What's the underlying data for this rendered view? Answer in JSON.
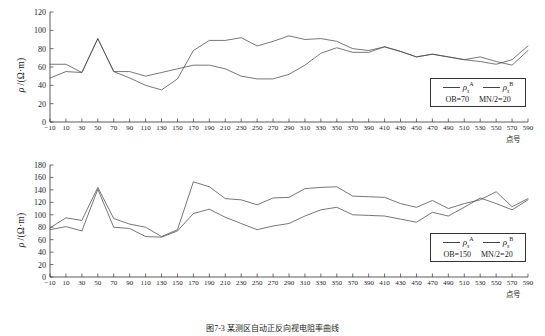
{
  "figure": {
    "caption": "图7-3  某测区自动正反向视电阻率曲线",
    "axis": {
      "ylabel_rho": "ρ",
      "ylabel_unit": "/(Ω·m)",
      "xlabel": "点号"
    }
  },
  "chart_data": [
    {
      "id": "top",
      "type": "line",
      "title": "",
      "xlabel": "点号",
      "ylabel": "ρ/(Ω·m)",
      "xlim": [
        -10,
        590
      ],
      "ylim": [
        0,
        120
      ],
      "ytick_step": 20,
      "xtick_step": 20,
      "grid": false,
      "legend_position": "bottom-right",
      "legend": {
        "entries": [
          "ρsA",
          "ρsB"
        ],
        "conditions": [
          "OB=70",
          "MN/2=20"
        ]
      },
      "yticks": [
        0,
        20,
        40,
        60,
        80,
        100,
        120
      ],
      "xticks": [
        -10,
        10,
        30,
        50,
        70,
        90,
        110,
        130,
        150,
        170,
        190,
        210,
        230,
        250,
        270,
        290,
        310,
        330,
        350,
        370,
        390,
        410,
        430,
        450,
        470,
        490,
        510,
        530,
        550,
        570,
        590
      ],
      "x": [
        -10,
        10,
        30,
        50,
        70,
        90,
        110,
        130,
        150,
        170,
        190,
        210,
        230,
        250,
        270,
        290,
        310,
        330,
        350,
        370,
        390,
        410,
        430,
        450,
        470,
        490,
        510,
        530,
        550,
        570,
        590
      ],
      "series": [
        {
          "name": "ρsA",
          "values": [
            63,
            63,
            54,
            91,
            55,
            55,
            50,
            54,
            58,
            62,
            62,
            58,
            50,
            47,
            47,
            52,
            62,
            75,
            81,
            76,
            76,
            82,
            77,
            71,
            74,
            71,
            68,
            71,
            66,
            62,
            78
          ]
        },
        {
          "name": "ρsB",
          "values": [
            48,
            55,
            54,
            91,
            55,
            48,
            40,
            35,
            47,
            78,
            89,
            89,
            92,
            83,
            88,
            94,
            90,
            91,
            88,
            80,
            78,
            82,
            77,
            71,
            74,
            71,
            68,
            66,
            63,
            68,
            83
          ]
        }
      ]
    },
    {
      "id": "bottom",
      "type": "line",
      "title": "",
      "xlabel": "点号",
      "ylabel": "ρ/(Ω·m)",
      "xlim": [
        -10,
        590
      ],
      "ylim": [
        0,
        180
      ],
      "ytick_step": 20,
      "xtick_step": 20,
      "grid": false,
      "legend_position": "bottom-right",
      "legend": {
        "entries": [
          "ρsA",
          "ρsB"
        ],
        "conditions": [
          "OB=150",
          "MN/2=20"
        ]
      },
      "yticks": [
        0,
        20,
        40,
        60,
        80,
        100,
        120,
        140,
        160,
        180
      ],
      "xticks": [
        -10,
        10,
        30,
        50,
        70,
        90,
        110,
        130,
        150,
        170,
        190,
        210,
        230,
        250,
        270,
        290,
        310,
        330,
        350,
        370,
        390,
        410,
        430,
        450,
        470,
        490,
        510,
        530,
        550,
        570,
        590
      ],
      "x": [
        -10,
        10,
        30,
        50,
        70,
        90,
        110,
        130,
        150,
        170,
        190,
        210,
        230,
        250,
        270,
        290,
        310,
        330,
        350,
        370,
        390,
        410,
        430,
        450,
        470,
        490,
        510,
        530,
        550,
        570,
        590
      ],
      "series": [
        {
          "name": "ρsA",
          "values": [
            79,
            95,
            91,
            144,
            94,
            85,
            80,
            65,
            76,
            153,
            145,
            126,
            124,
            116,
            127,
            128,
            142,
            144,
            145,
            130,
            129,
            128,
            118,
            112,
            123,
            110,
            118,
            124,
            137,
            113,
            126
          ]
        },
        {
          "name": "ρsB",
          "values": [
            76,
            81,
            74,
            141,
            80,
            78,
            65,
            64,
            74,
            102,
            109,
            96,
            86,
            76,
            82,
            86,
            98,
            108,
            112,
            100,
            99,
            98,
            93,
            88,
            104,
            98,
            112,
            127,
            118,
            108,
            124
          ]
        }
      ]
    }
  ]
}
